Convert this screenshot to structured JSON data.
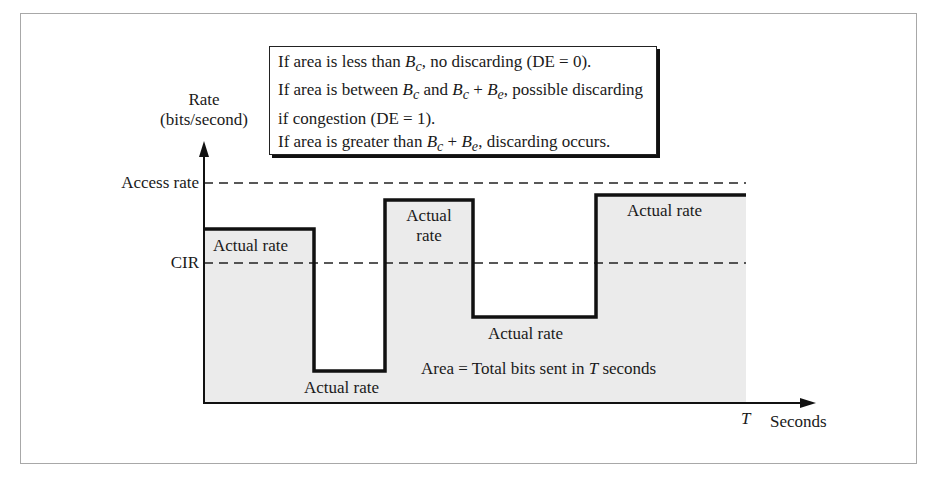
{
  "diagram": {
    "type": "frame-relay rate diagram",
    "y_axis": {
      "label_line1": "Rate",
      "label_line2": "(bits/second)"
    },
    "x_axis": {
      "end_marker": "T",
      "label": "Seconds"
    },
    "reference_lines": [
      {
        "name": "access-rate",
        "label": "Access rate",
        "style": "dashed"
      },
      {
        "name": "cir",
        "label": "CIR",
        "style": "dashed"
      }
    ],
    "segments": [
      {
        "label": "Actual rate",
        "level": "above CIR"
      },
      {
        "label": "Actual rate",
        "level": "well below CIR"
      },
      {
        "label_line1": "Actual",
        "label_line2": "rate",
        "level": "near access rate"
      },
      {
        "label": "Actual rate",
        "level": "below CIR"
      },
      {
        "label": "Actual rate",
        "level": "near access rate"
      }
    ],
    "area_label": {
      "prefix": "Area = Total bits sent in ",
      "var": "T",
      "suffix": " seconds"
    },
    "legend": {
      "line1": {
        "a": "If area is less than ",
        "b": "B",
        "b_sub": "c",
        "c": ", no discarding (DE = 0)."
      },
      "line2": {
        "a": "If area is between ",
        "b": "B",
        "b_sub": "c",
        "c": " and ",
        "d": "B",
        "d_sub": "c",
        "e": " + ",
        "f": "B",
        "f_sub": "e",
        "g": ", possible discarding"
      },
      "line3": "if congestion (DE = 1).",
      "line4": {
        "a": "If area is greater than ",
        "b": "B",
        "b_sub": "c",
        "c": " + ",
        "d": "B",
        "d_sub": "e",
        "e": ", discarding occurs."
      }
    },
    "colors": {
      "area_fill": "#ebebeb",
      "line": "#111111",
      "frame": "#a8a8a8"
    }
  }
}
